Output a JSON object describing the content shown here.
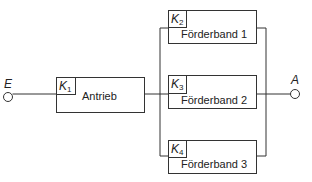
{
  "diagram": {
    "input": {
      "label": "E"
    },
    "output": {
      "label": "A"
    },
    "components": [
      {
        "id": "K",
        "sub": "1",
        "name": "Antrieb"
      },
      {
        "id": "K",
        "sub": "2",
        "name": "Förderband 1"
      },
      {
        "id": "K",
        "sub": "3",
        "name": "Förderband 2"
      },
      {
        "id": "K",
        "sub": "4",
        "name": "Förderband 3"
      }
    ],
    "line_color": "#333333"
  }
}
